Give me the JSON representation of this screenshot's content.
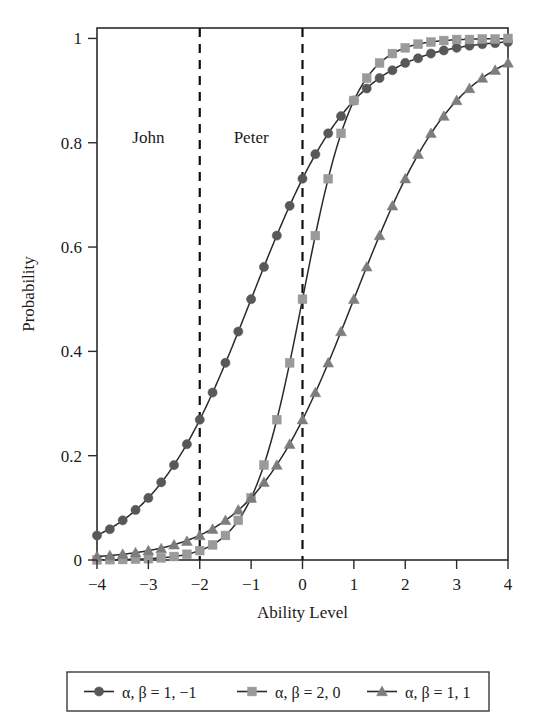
{
  "chart_data": {
    "type": "line",
    "title": "",
    "xlabel": "Ability Level",
    "ylabel": "Probability",
    "xlim": [
      -4,
      4
    ],
    "ylim": [
      0,
      1.02
    ],
    "grid": false,
    "legend_position": "below-axes",
    "x_ticks": [
      "−4",
      "−3",
      "−2",
      "−1",
      "0",
      "1",
      "2",
      "3",
      "4"
    ],
    "x_tick_values": [
      -4,
      -3,
      -2,
      -1,
      0,
      1,
      2,
      3,
      4
    ],
    "y_ticks": [
      "0",
      "0.2",
      "0.4",
      "0.6",
      "0.8",
      "1"
    ],
    "y_tick_values": [
      0,
      0.2,
      0.4,
      0.6,
      0.8,
      1
    ],
    "marker_step": 0.25,
    "annotations": [
      {
        "text": "John",
        "x": -3.0,
        "y": 0.8,
        "name": "john"
      },
      {
        "text": "Peter",
        "x": -1.0,
        "y": 0.8,
        "name": "peter"
      }
    ],
    "reference_lines": [
      {
        "x": -2,
        "style": "dashed"
      },
      {
        "x": 0,
        "style": "dashed"
      }
    ],
    "series": [
      {
        "name": "α, β = 1, −1",
        "marker": "circle",
        "color": "#585858",
        "alpha": 1,
        "beta": -1,
        "x": [
          -4,
          -3.75,
          -3.5,
          -3.25,
          -3,
          -2.75,
          -2.5,
          -2.25,
          -2,
          -1.75,
          -1.5,
          -1.25,
          -1,
          -0.75,
          -0.5,
          -0.25,
          0,
          0.25,
          0.5,
          0.75,
          1,
          1.25,
          1.5,
          1.75,
          2,
          2.25,
          2.5,
          2.75,
          3,
          3.25,
          3.5,
          3.75,
          4
        ],
        "values": [
          0.047,
          0.059,
          0.076,
          0.096,
          0.119,
          0.149,
          0.182,
          0.222,
          0.269,
          0.321,
          0.378,
          0.438,
          0.5,
          0.562,
          0.622,
          0.679,
          0.731,
          0.778,
          0.818,
          0.851,
          0.881,
          0.904,
          0.924,
          0.939,
          0.953,
          0.962,
          0.971,
          0.977,
          0.982,
          0.986,
          0.989,
          0.991,
          0.993
        ]
      },
      {
        "name": "α, β = 2, 0",
        "marker": "square",
        "color": "#9a9a9a",
        "alpha": 2,
        "beta": 0,
        "x": [
          -4,
          -3.75,
          -3.5,
          -3.25,
          -3,
          -2.75,
          -2.5,
          -2.25,
          -2,
          -1.75,
          -1.5,
          -1.25,
          -1,
          -0.75,
          -0.5,
          -0.25,
          0,
          0.25,
          0.5,
          0.75,
          1,
          1.25,
          1.5,
          1.75,
          2,
          2.25,
          2.5,
          2.75,
          3,
          3.25,
          3.5,
          3.75,
          4
        ],
        "values": [
          0.0003,
          0.0006,
          0.0009,
          0.0015,
          0.0025,
          0.0041,
          0.0067,
          0.011,
          0.018,
          0.029,
          0.047,
          0.076,
          0.119,
          0.182,
          0.269,
          0.378,
          0.5,
          0.622,
          0.731,
          0.818,
          0.881,
          0.924,
          0.953,
          0.971,
          0.982,
          0.989,
          0.993,
          0.996,
          0.998,
          0.998,
          0.999,
          0.999,
          1.0
        ]
      },
      {
        "name": "α, β = 1, 1",
        "marker": "triangle",
        "color": "#7d7d7d",
        "alpha": 1,
        "beta": 1,
        "x": [
          -4,
          -3.75,
          -3.5,
          -3.25,
          -3,
          -2.75,
          -2.5,
          -2.25,
          -2,
          -1.75,
          -1.5,
          -1.25,
          -1,
          -0.75,
          -0.5,
          -0.25,
          0,
          0.25,
          0.5,
          0.75,
          1,
          1.25,
          1.5,
          1.75,
          2,
          2.25,
          2.5,
          2.75,
          3,
          3.25,
          3.5,
          3.75,
          4
        ],
        "values": [
          0.0067,
          0.0085,
          0.011,
          0.014,
          0.018,
          0.022,
          0.029,
          0.036,
          0.047,
          0.059,
          0.076,
          0.096,
          0.119,
          0.149,
          0.182,
          0.222,
          0.269,
          0.321,
          0.378,
          0.438,
          0.5,
          0.562,
          0.622,
          0.679,
          0.731,
          0.778,
          0.818,
          0.851,
          0.881,
          0.904,
          0.924,
          0.939,
          0.953
        ]
      }
    ]
  },
  "legend": {
    "entries": [
      {
        "label": "α, β = 1, −1",
        "marker": "circle",
        "color": "#585858"
      },
      {
        "label": "α, β = 2, 0",
        "marker": "square",
        "color": "#9a9a9a"
      },
      {
        "label": "α, β = 1, 1",
        "marker": "triangle",
        "color": "#7d7d7d"
      }
    ]
  }
}
